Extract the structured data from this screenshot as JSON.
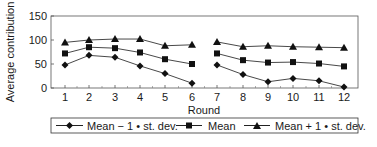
{
  "chart_data": {
    "type": "line",
    "title": "",
    "xlabel": "Round",
    "ylabel": "Average contribution",
    "ylim": [
      0,
      150
    ],
    "yticks": [
      0,
      50,
      100,
      150
    ],
    "x": [
      1,
      2,
      3,
      4,
      5,
      6,
      7,
      8,
      9,
      10,
      11,
      12
    ],
    "segments_break_between": [
      6,
      7
    ],
    "grid": false,
    "legend_position": "bottom",
    "series": [
      {
        "name": "Mean − 1 • st. dev.",
        "marker": "diamond",
        "values": [
          48,
          68,
          64,
          46,
          30,
          10,
          48,
          28,
          13,
          20,
          15,
          2
        ]
      },
      {
        "name": "Mean",
        "marker": "square",
        "values": [
          72,
          85,
          83,
          74,
          60,
          50,
          72,
          58,
          53,
          54,
          51,
          45
        ]
      },
      {
        "name": "Mean + 1 • st. dev.",
        "marker": "triangle",
        "values": [
          95,
          100,
          102,
          102,
          88,
          90,
          96,
          86,
          88,
          86,
          85,
          84
        ]
      }
    ]
  },
  "axis": {
    "ylabel": "Average contribution",
    "xlabel": "Round"
  },
  "legend": {
    "items": [
      {
        "label": "Mean − 1 • st. dev."
      },
      {
        "label": "Mean"
      },
      {
        "label": "Mean + 1 • st. dev."
      }
    ]
  }
}
